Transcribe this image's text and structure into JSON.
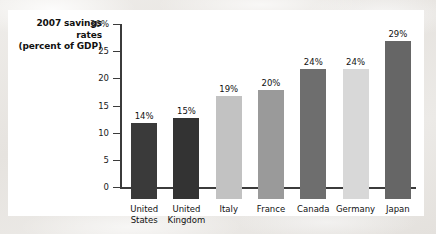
{
  "chart_data": {
    "type": "bar",
    "title": "2007 savings rates (percent of GDP)",
    "title_lines": [
      "2007 savings",
      "rates",
      "(percent of GDP)"
    ],
    "xlabel": "",
    "ylabel": "",
    "ylim": [
      0,
      30
    ],
    "yticks": [
      0,
      5,
      10,
      15,
      20,
      25,
      30
    ],
    "ytick_labels": [
      "0",
      "5",
      "10",
      "15",
      "20",
      "25",
      "30%"
    ],
    "grid": false,
    "legend": "none",
    "categories": [
      "United States",
      "United Kingdom",
      "Italy",
      "France",
      "Canada",
      "Germany",
      "Japan"
    ],
    "category_lines": [
      [
        "United",
        "States"
      ],
      [
        "United",
        "Kingdom"
      ],
      [
        "Italy"
      ],
      [
        "France"
      ],
      [
        "Canada"
      ],
      [
        "Germany"
      ],
      [
        "Japan"
      ]
    ],
    "values": [
      14,
      15,
      19,
      20,
      24,
      24,
      29
    ],
    "data_labels": [
      "14%",
      "15%",
      "19%",
      "20%",
      "24%",
      "24%",
      "29%"
    ],
    "bar_colors": [
      "#3a3a3a",
      "#333333",
      "#c2c2c2",
      "#9a9a9a",
      "#6e6e6e",
      "#d8d8d8",
      "#666666"
    ],
    "axis_color": "#3b3b3b",
    "panel_color": "#ffffff",
    "text_color": "#111111"
  }
}
